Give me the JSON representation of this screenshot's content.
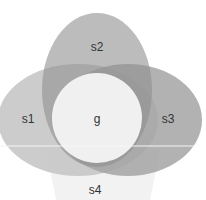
{
  "diagram": {
    "type": "venn",
    "sets": [
      {
        "id": "s1",
        "label": "s1",
        "color": "#c8c8c8"
      },
      {
        "id": "s2",
        "label": "s2",
        "color": "#9e9e9e"
      },
      {
        "id": "s3",
        "label": "s3",
        "color": "#a9a9a9"
      },
      {
        "id": "s4",
        "label": "s4",
        "color": "#f2f2f2"
      },
      {
        "id": "g",
        "label": "g",
        "color": "#f7f7f7"
      }
    ],
    "divider_color": "#f4f4f4"
  }
}
